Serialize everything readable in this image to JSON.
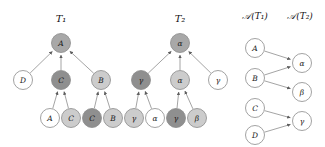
{
  "figure": {
    "caption_titles": {
      "tree1": "T₁",
      "tree2": "T₂",
      "alignment1": "𝒜(T₁)",
      "alignment2": "𝒜(T₂)"
    },
    "colors": {
      "white": "#ffffff",
      "light_gray": "#cccccc",
      "medium_gray": "#a8a8a8",
      "dark_gray": "#8f8f8f",
      "stroke": "#8a8a8a",
      "edge": "#8d8d8d",
      "text": "#1a1a1a"
    }
  },
  "tree1": {
    "title": "T₁",
    "nodes": [
      {
        "id": "t1-root",
        "label": "A",
        "x": 61,
        "y": 43,
        "r": 9.5,
        "shade": "medium_gray",
        "level": "root"
      },
      {
        "id": "t1-c1",
        "label": "D",
        "x": 23,
        "y": 80,
        "r": 9.5,
        "shade": "white",
        "level": "mid"
      },
      {
        "id": "t1-c2",
        "label": "C",
        "x": 61,
        "y": 80,
        "r": 9.5,
        "shade": "dark_gray",
        "level": "mid"
      },
      {
        "id": "t1-c3",
        "label": "B",
        "x": 101,
        "y": 80,
        "r": 9.5,
        "shade": "light_gray",
        "level": "mid"
      },
      {
        "id": "t1-l1",
        "label": "A",
        "x": 50,
        "y": 118,
        "r": 9.5,
        "shade": "white",
        "level": "leaf"
      },
      {
        "id": "t1-l2",
        "label": "C",
        "x": 71,
        "y": 118,
        "r": 9.5,
        "shade": "light_gray",
        "level": "leaf"
      },
      {
        "id": "t1-l3",
        "label": "C",
        "x": 92,
        "y": 118,
        "r": 9.5,
        "shade": "dark_gray",
        "level": "leaf"
      },
      {
        "id": "t1-l4",
        "label": "B",
        "x": 113,
        "y": 118,
        "r": 9.5,
        "shade": "light_gray",
        "level": "leaf"
      }
    ],
    "edges": [
      {
        "from": "t1-c1",
        "to": "t1-root"
      },
      {
        "from": "t1-c2",
        "to": "t1-root"
      },
      {
        "from": "t1-c3",
        "to": "t1-root"
      },
      {
        "from": "t1-l1",
        "to": "t1-c2"
      },
      {
        "from": "t1-l2",
        "to": "t1-c2"
      },
      {
        "from": "t1-l3",
        "to": "t1-c3"
      },
      {
        "from": "t1-l4",
        "to": "t1-c3"
      }
    ],
    "title_x": 61,
    "title_y": 22
  },
  "tree2": {
    "title": "T₂",
    "nodes": [
      {
        "id": "t2-root",
        "label": "α",
        "x": 180,
        "y": 43,
        "r": 9.5,
        "shade": "medium_gray",
        "level": "root"
      },
      {
        "id": "t2-c1",
        "label": "γ",
        "x": 141,
        "y": 80,
        "r": 9.5,
        "shade": "dark_gray",
        "level": "mid"
      },
      {
        "id": "t2-c2",
        "label": "α",
        "x": 180,
        "y": 80,
        "r": 9.5,
        "shade": "light_gray",
        "level": "mid"
      },
      {
        "id": "t2-c3",
        "label": "γ",
        "x": 218,
        "y": 80,
        "r": 9.5,
        "shade": "white",
        "level": "mid"
      },
      {
        "id": "t2-l1",
        "label": "γ",
        "x": 134,
        "y": 118,
        "r": 9.5,
        "shade": "light_gray",
        "level": "leaf"
      },
      {
        "id": "t2-l2",
        "label": "α",
        "x": 155,
        "y": 118,
        "r": 9.5,
        "shade": "white",
        "level": "leaf"
      },
      {
        "id": "t2-l3",
        "label": "γ",
        "x": 176,
        "y": 118,
        "r": 9.5,
        "shade": "dark_gray",
        "level": "leaf"
      },
      {
        "id": "t2-l4",
        "label": "β",
        "x": 197,
        "y": 118,
        "r": 9.5,
        "shade": "light_gray",
        "level": "leaf"
      }
    ],
    "edges": [
      {
        "from": "t2-c1",
        "to": "t2-root"
      },
      {
        "from": "t2-c2",
        "to": "t2-root"
      },
      {
        "from": "t2-c3",
        "to": "t2-root"
      },
      {
        "from": "t2-l1",
        "to": "t2-c1"
      },
      {
        "from": "t2-l2",
        "to": "t2-c1"
      },
      {
        "from": "t2-l3",
        "to": "t2-c2"
      },
      {
        "from": "t2-l4",
        "to": "t2-c2"
      }
    ],
    "title_x": 180,
    "title_y": 22
  },
  "alignment": {
    "left_title": "𝒜(T₁)",
    "right_title": "𝒜(T₂)",
    "left_title_x": 255,
    "right_title_x": 300,
    "title_y": 19,
    "nodes": [
      {
        "id": "a-A",
        "label": "A",
        "x": 255,
        "y": 48,
        "r": 9.5,
        "shade": "white",
        "side": "left"
      },
      {
        "id": "a-B",
        "label": "B",
        "x": 255,
        "y": 78,
        "r": 9.5,
        "shade": "white",
        "side": "left"
      },
      {
        "id": "a-C",
        "label": "C",
        "x": 255,
        "y": 108,
        "r": 9.5,
        "shade": "white",
        "side": "left"
      },
      {
        "id": "a-D",
        "label": "D",
        "x": 255,
        "y": 135,
        "r": 9.5,
        "shade": "white",
        "side": "left"
      },
      {
        "id": "a-alpha",
        "label": "α",
        "x": 302,
        "y": 63,
        "r": 9.5,
        "shade": "white",
        "side": "right"
      },
      {
        "id": "a-beta",
        "label": "β",
        "x": 302,
        "y": 92,
        "r": 9.5,
        "shade": "white",
        "side": "right"
      },
      {
        "id": "a-gamma",
        "label": "γ",
        "x": 302,
        "y": 121,
        "r": 9.5,
        "shade": "white",
        "side": "right"
      }
    ],
    "edges": [
      {
        "from": "a-A",
        "to": "a-alpha"
      },
      {
        "from": "a-B",
        "to": "a-alpha"
      },
      {
        "from": "a-B",
        "to": "a-beta"
      },
      {
        "from": "a-C",
        "to": "a-gamma"
      },
      {
        "from": "a-D",
        "to": "a-gamma"
      }
    ]
  }
}
